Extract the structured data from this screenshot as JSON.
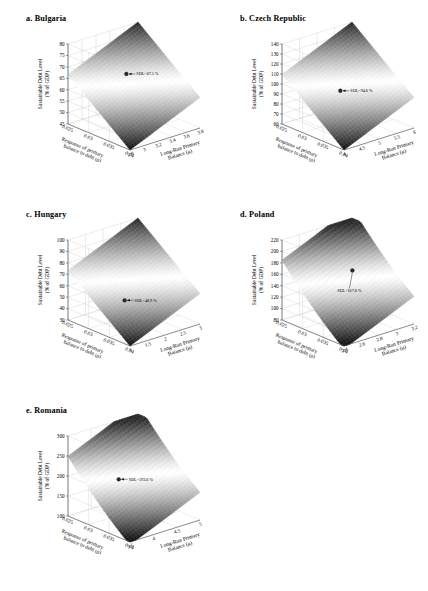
{
  "figure": {
    "panel_count": 5,
    "surface_colormap": "grayscale-bone",
    "background": "#ffffff"
  },
  "axis_titles": {
    "z": "Sustainable Debt Level",
    "z_sub": "(% of GDP)",
    "x_line1": "Response of primary",
    "x_line2": "balance to debt (ρ)",
    "y_line1": "Long-Run Primary",
    "y_line2": "Balance (μ)"
  },
  "chart_data": [
    {
      "type": "surface",
      "panel": "a",
      "title": "a. Bulgaria",
      "country": "Bulgaria",
      "xlabel": "Response of primary balance to debt (ρ)",
      "ylabel": "Long-Run Primary Balance (μ)",
      "zlabel": "Sustainable Debt Level (% of GDP)",
      "x": [
        0.025,
        0.03,
        0.035,
        0.04
      ],
      "x_ticks": [
        "0.025",
        "0.03",
        "0.035",
        "0.04"
      ],
      "y": [
        2.8,
        3,
        3.2,
        3.4,
        3.6,
        3.8
      ],
      "y_ticks": [
        "2.8",
        "3",
        "3.2",
        "3.4",
        "3.6",
        "3.8"
      ],
      "z_ticks": [
        45,
        50,
        55,
        60,
        65,
        70,
        75,
        80
      ],
      "zlim": [
        45,
        80
      ],
      "marker": {
        "label": "SDL=67.5 %",
        "z": 67.5,
        "x": 0.0315,
        "y": 3.25
      },
      "grid": true
    },
    {
      "type": "surface",
      "panel": "b",
      "title": "b. Czech Republic",
      "country": "Czech Republic",
      "xlabel": "Response of primary balance to debt (ρ)",
      "ylabel": "Long-Run Primary Balance (μ)",
      "zlabel": "Sustainable Debt Level (% of GDP)",
      "x": [
        0.025,
        0.03,
        0.035,
        0.04
      ],
      "x_ticks": [
        "0.025",
        "0.03",
        "0.035",
        "0.04"
      ],
      "y": [
        4,
        4.5,
        5,
        5.5,
        6
      ],
      "y_ticks": [
        "4",
        "4.5",
        "5",
        "5.5",
        "6"
      ],
      "z_ticks": [
        60,
        70,
        80,
        90,
        100,
        110,
        120,
        130,
        140
      ],
      "zlim": [
        60,
        140
      ],
      "marker": {
        "label": "SDL=94.6 %",
        "z": 94.6,
        "x": 0.0315,
        "y": 4.9
      },
      "grid": true
    },
    {
      "type": "surface",
      "panel": "c",
      "title": "c. Hungary",
      "country": "Hungary",
      "xlabel": "Response of primary balance to debt (ρ)",
      "ylabel": "Long-Run Primary Balance (μ)",
      "zlabel": "Sustainable Debt Level (% of GDP)",
      "x": [
        0.025,
        0.03,
        0.035,
        0.04
      ],
      "x_ticks": [
        "0.025",
        "0.03",
        "0.035",
        "0.04"
      ],
      "y": [
        1,
        1.5,
        2,
        2.5,
        3
      ],
      "y_ticks": [
        "1",
        "1.5",
        "2",
        "2.5",
        "3"
      ],
      "z_ticks": [
        30,
        40,
        50,
        60,
        70,
        80,
        90,
        100
      ],
      "zlim": [
        30,
        100
      ],
      "marker": {
        "label": "SDL=48.9 %",
        "z": 48.9,
        "x": 0.0315,
        "y": 1.85
      },
      "grid": true
    },
    {
      "type": "surface",
      "panel": "d",
      "title": "d. Poland",
      "country": "Poland",
      "xlabel": "Response of primary balance to debt (ρ)",
      "ylabel": "Long-Run Primary Balance (μ)",
      "zlabel": "Sustainable Debt Level (% of GDP)",
      "x": [
        0.025,
        0.03,
        0.035,
        0.04
      ],
      "x_ticks": [
        "0.025",
        "0.03",
        "0.035",
        "0.04"
      ],
      "y": [
        2.4,
        2.6,
        2.8,
        3,
        3.2
      ],
      "y_ticks": [
        "2.4",
        "2.6",
        "2.8",
        "3",
        "3.2"
      ],
      "z_ticks": [
        80,
        100,
        120,
        140,
        160,
        180,
        200,
        220
      ],
      "zlim": [
        80,
        220
      ],
      "marker": {
        "label": "SDL=167.8 %",
        "z": 167.8,
        "x": 0.0325,
        "y": 2.85
      },
      "grid": true
    },
    {
      "type": "surface",
      "panel": "e",
      "title": "e. Romania",
      "country": "Romania",
      "xlabel": "Response of primary balance to debt (ρ)",
      "ylabel": "Long-Run Primary Balance (μ)",
      "zlabel": "Sustainable Debt Level (% of GDP)",
      "x": [
        0.025,
        0.03,
        0.035,
        0.04
      ],
      "x_ticks": [
        "0.025",
        "0.03",
        "0.035",
        "0.04"
      ],
      "y": [
        3.5,
        4,
        4.5,
        5
      ],
      "y_ticks": [
        "3.5",
        "4",
        "4.5",
        "5"
      ],
      "z_ticks": [
        100,
        150,
        200,
        250,
        300
      ],
      "zlim": [
        100,
        300
      ],
      "marker": {
        "label": "SDL=193.6 %",
        "z": 193.6,
        "x": 0.0305,
        "y": 4.1
      },
      "grid": true
    }
  ]
}
